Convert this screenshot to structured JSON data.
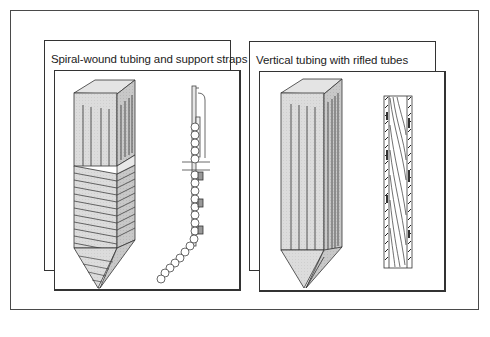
{
  "figure": {
    "panels": [
      {
        "id": "spiral",
        "title": "Spiral-wound tubing and support straps",
        "illustrations": [
          "furnace-column-spiral-wound",
          "tube-wall-side-view-with-support-straps"
        ]
      },
      {
        "id": "vertical",
        "title": "Vertical tubing with rifled tubes",
        "illustrations": [
          "furnace-column-vertical-tubes",
          "rifled-tube-section"
        ]
      }
    ]
  },
  "colors": {
    "line": "#333333",
    "fill": "#d8d8d8",
    "fill_dark": "#c4c4c4",
    "background": "#ffffff"
  }
}
